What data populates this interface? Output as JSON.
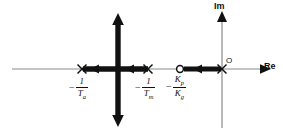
{
  "figure": {
    "width": 283,
    "height": 134,
    "background": "#ffffff",
    "locus_color": "#111111",
    "axis_color": "#8a8a8a"
  },
  "axes": {
    "real": {
      "label": "Re",
      "name": "real-axis",
      "y": 69,
      "x_start": 12,
      "x_end": 272,
      "arrow": "right"
    },
    "imaginary": {
      "label": "Im",
      "name": "imaginary-axis",
      "x": 222,
      "y_start": 10,
      "y_end": 128,
      "arrow": "up"
    },
    "origin": {
      "label": "O",
      "x": 222,
      "y": 69
    }
  },
  "poles": [
    {
      "marker": "x",
      "x": 82,
      "y": 69,
      "label_plain": "-1/Ta",
      "num": "1",
      "den": "T",
      "den_sub": "a"
    },
    {
      "marker": "x",
      "x": 148,
      "y": 69,
      "label_plain": "-1/Tm",
      "num": "1",
      "den": "T",
      "den_sub": "m"
    },
    {
      "marker": "x",
      "x": 222,
      "y": 69,
      "label_plain": "0",
      "num": "",
      "den": "",
      "den_sub": ""
    }
  ],
  "zeros": [
    {
      "marker": "o",
      "x": 180,
      "y": 69,
      "label_plain": "-Kp/Kg",
      "num": "K",
      "num_sub": "p",
      "den": "K",
      "den_sub": "g"
    }
  ],
  "labels": {
    "pole_a": {
      "minus": "−",
      "num": "1",
      "den": "T",
      "den_sub": "a",
      "x": 70,
      "y": 77
    },
    "pole_m": {
      "minus": "−",
      "num": "1",
      "den": "T",
      "den_sub": "m",
      "x": 136,
      "y": 77
    },
    "zero_kp_kg": {
      "minus": "−",
      "num": "K",
      "num_sub": "p",
      "den": "K",
      "den_sub": "g",
      "x": 168,
      "y": 76
    },
    "im_axis": {
      "text": "Im",
      "x": 218,
      "y": 2
    },
    "re_axis": {
      "text": "Re",
      "x": 264,
      "y": 63
    },
    "origin": {
      "text": "O",
      "x": 226,
      "y": 58
    }
  },
  "branches": [
    {
      "name": "real-axis-segment-left",
      "type": "thick-segment",
      "from_x": 82,
      "to_x": 148,
      "y": 69,
      "direction": "left",
      "arrow_count": 2
    },
    {
      "name": "real-axis-segment-right",
      "type": "thick-segment",
      "from_x": 180,
      "to_x": 222,
      "y": 69,
      "direction": "left",
      "arrow_count": 1
    },
    {
      "name": "vertical-breakaway-branch",
      "type": "thick-double-arrow",
      "x": 118,
      "from_y": 15,
      "to_y": 126,
      "direction": "both"
    }
  ]
}
